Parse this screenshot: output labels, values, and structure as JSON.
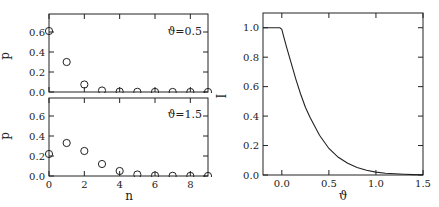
{
  "chart_data": [
    {
      "type": "scatter",
      "panel": "top-left",
      "annotation": "ϑ=0.5",
      "xlabel": "",
      "ylabel": "p",
      "xlim": [
        0,
        9
      ],
      "ylim": [
        0,
        0.78
      ],
      "xticks": [
        0,
        2,
        4,
        6,
        8
      ],
      "yticks": [
        0.0,
        0.2,
        0.4,
        0.6
      ],
      "ytick_labels": [
        "0.0",
        "0.2",
        "0.4",
        "0.6"
      ],
      "show_xtick_labels": false,
      "marker": "open-circle",
      "x": [
        0,
        1,
        2,
        3,
        4,
        5,
        6,
        7,
        8,
        9
      ],
      "values": [
        0.61,
        0.3,
        0.075,
        0.015,
        0.004,
        0.002,
        0.001,
        0.0005,
        0.0002,
        0.0001
      ]
    },
    {
      "type": "scatter",
      "panel": "bottom-left",
      "annotation": "ϑ=1.5",
      "xlabel": "n",
      "ylabel": "p",
      "xlim": [
        0,
        9
      ],
      "ylim": [
        0,
        0.78
      ],
      "xticks": [
        0,
        2,
        4,
        6,
        8
      ],
      "xtick_labels": [
        "0",
        "2",
        "4",
        "6",
        "8"
      ],
      "yticks": [
        0.0,
        0.2,
        0.4,
        0.6
      ],
      "ytick_labels": [
        "0.0",
        "0.2",
        "0.4",
        "0.6"
      ],
      "show_xtick_labels": true,
      "marker": "open-circle",
      "x": [
        0,
        1,
        2,
        3,
        4,
        5,
        6,
        7,
        8,
        9
      ],
      "values": [
        0.22,
        0.33,
        0.25,
        0.12,
        0.05,
        0.015,
        0.005,
        0.002,
        0.001,
        0.0003
      ]
    },
    {
      "type": "line",
      "panel": "right",
      "xlabel": "ϑ",
      "ylabel": "I",
      "xlim": [
        -0.2,
        1.5
      ],
      "ylim": [
        0,
        1.1
      ],
      "xticks": [
        0.0,
        0.5,
        1.0,
        1.5
      ],
      "xtick_labels": [
        "0.0",
        "0.5",
        "1.0",
        "1.5"
      ],
      "yticks": [
        0.0,
        0.2,
        0.4,
        0.6,
        0.8,
        1.0
      ],
      "ytick_labels": [
        "0.0",
        "0.2",
        "0.4",
        "0.6",
        "0.8",
        "1.0"
      ],
      "x": [
        -0.2,
        -0.1,
        -0.02,
        0.0,
        0.02,
        0.05,
        0.1,
        0.15,
        0.2,
        0.25,
        0.3,
        0.4,
        0.5,
        0.6,
        0.7,
        0.8,
        0.9,
        1.0,
        1.1,
        1.2,
        1.3,
        1.4,
        1.5
      ],
      "values": [
        1.0,
        1.0,
        1.0,
        0.99,
        0.94,
        0.87,
        0.76,
        0.65,
        0.55,
        0.46,
        0.39,
        0.27,
        0.18,
        0.12,
        0.08,
        0.05,
        0.032,
        0.02,
        0.012,
        0.008,
        0.005,
        0.003,
        0.002
      ]
    }
  ],
  "panels": {
    "top_left": {
      "annotation": "ϑ=0.5",
      "ylabel": "p"
    },
    "bottom_left": {
      "annotation": "ϑ=1.5",
      "ylabel": "p",
      "xlabel": "n"
    },
    "right": {
      "ylabel": "I",
      "xlabel": "ϑ"
    }
  },
  "style": {
    "ink": "#222222",
    "background": "#ffffff"
  }
}
